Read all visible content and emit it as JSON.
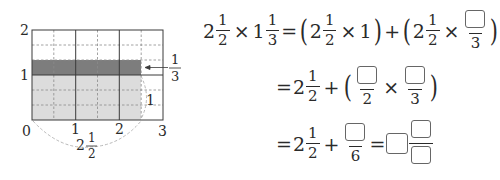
{
  "diagram": {
    "type": "area-model",
    "x_range": [
      0,
      3
    ],
    "y_range": [
      0,
      2
    ],
    "x_tick_labels": [
      "0",
      "1",
      "2",
      "3"
    ],
    "y_tick_labels": [
      "1",
      "2"
    ],
    "vertical_division": 0.5,
    "horizontal_division": 0.3333,
    "light_region": {
      "x": [
        0,
        2.5
      ],
      "y": [
        0,
        1
      ],
      "color": "#dcdcdc"
    },
    "dark_region": {
      "x": [
        0,
        2.5
      ],
      "y": [
        1,
        1.3333
      ],
      "color": "#7d7d7d"
    },
    "width_label": {
      "whole": "2",
      "num": "1",
      "den": "2"
    },
    "height_label_whole": "1",
    "arrow_label": {
      "num": "1",
      "den": "3"
    },
    "colors": {
      "line": "#3a3a3a",
      "dashed": "#8a8a8a",
      "brace": "#b0b0b0"
    }
  },
  "equation": {
    "line1": {
      "lhs": [
        {
          "whole": "2",
          "num": "1",
          "den": "2"
        },
        {
          "whole": "1",
          "num": "1",
          "den": "3"
        }
      ],
      "times": "×",
      "equals": "=",
      "term1": {
        "whole": "2",
        "num": "1",
        "den": "2",
        "factor": "1"
      },
      "plus": "+",
      "term2": {
        "whole": "2",
        "num": "1",
        "den": "2",
        "frac_den": "3",
        "frac_num_blank": true
      }
    },
    "line2": {
      "equals": "=",
      "mixed": {
        "whole": "2",
        "num": "1",
        "den": "2"
      },
      "plus": "+",
      "frac1_den": "2",
      "frac2_den": "3",
      "times": "×"
    },
    "line3": {
      "equals": "=",
      "mixed": {
        "whole": "2",
        "num": "1",
        "den": "2"
      },
      "plus": "+",
      "frac_den": "6",
      "equals2": "="
    }
  }
}
